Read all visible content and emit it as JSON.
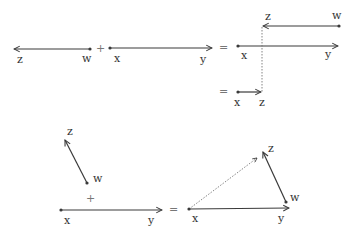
{
  "colors": {
    "stroke": "#3a3a3a",
    "dotted": "#777777",
    "text": "#333333",
    "operator": "#777777",
    "background": "#ffffff"
  },
  "top": {
    "term1": {
      "tail_label": "w",
      "head_label": "z"
    },
    "plus": "+",
    "term2": {
      "tail_label": "x",
      "head_label": "y"
    },
    "equals1": "=",
    "result_upper": {
      "tail_label": "w",
      "head_label": "z"
    },
    "result_lower": {
      "tail_label": "x",
      "head_label": "y"
    },
    "equals2": "=",
    "composite": {
      "tail_label": "x",
      "head_label": "z"
    }
  },
  "bottom": {
    "term1": {
      "tail_label": "w",
      "head_label": "z"
    },
    "plus": "+",
    "term2": {
      "tail_label": "x",
      "head_label": "y"
    },
    "equals": "=",
    "triangle": {
      "base": {
        "tail_label": "x",
        "head_label": "y"
      },
      "side": {
        "tail_label": "w",
        "head_label": "z"
      }
    }
  }
}
